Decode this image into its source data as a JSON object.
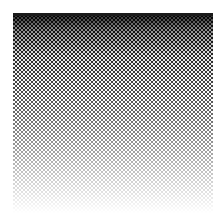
{
  "image": {
    "description": "halftone-gradient-square",
    "gradient_direction": "top-to-bottom",
    "colors": {
      "dark": "#111111",
      "light": "#ffffff",
      "background": "#ffffff"
    },
    "dot_pattern": "checkerboard",
    "dot_period_px": 4
  }
}
